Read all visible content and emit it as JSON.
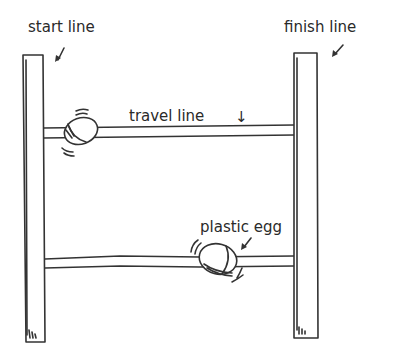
{
  "diagram": {
    "labels": {
      "start_line": "start line",
      "finish_line": "finish line",
      "travel_line": "travel line",
      "plastic_egg": "plastic egg"
    },
    "arrows": {
      "travel_line_arrow": "↓"
    },
    "components": [
      "start post",
      "finish post",
      "upper travel line",
      "lower travel line",
      "upper egg",
      "lower egg"
    ],
    "ink_color": "#333333",
    "background": "#ffffff"
  }
}
